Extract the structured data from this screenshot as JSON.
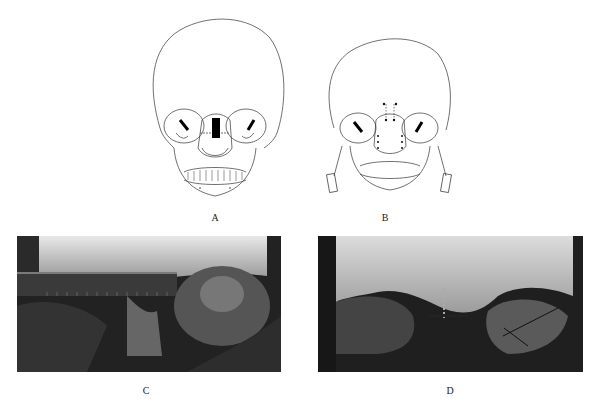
{
  "figure": {
    "panels": [
      {
        "id": "A",
        "label": "A",
        "kind": "illustration",
        "description": "Frontal skull line drawing with black bar graft between orbits and horizontal arrows"
      },
      {
        "id": "B",
        "label": "B",
        "kind": "illustration",
        "description": "Frontal skull line drawing with dotted fixation points along nasal region and detached mandibular segments"
      },
      {
        "id": "C",
        "label": "C",
        "kind": "photo",
        "description": "Intraoperative grayscale photo with ruler across interorbital region"
      },
      {
        "id": "D",
        "label": "D",
        "kind": "photo",
        "description": "Intraoperative grayscale photo showing fixation at nasal bridge after correction"
      }
    ]
  }
}
